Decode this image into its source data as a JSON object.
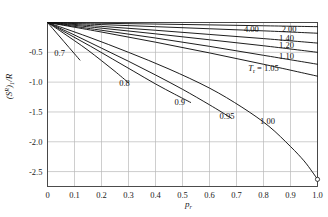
{
  "chart_data": {
    "type": "line",
    "title": "",
    "subtitle": "",
    "xlabel": "p_r",
    "ylabel": "(S^R)_1/R",
    "xlim": [
      0,
      1.0
    ],
    "ylim": [
      -2.75,
      0
    ],
    "grid": true,
    "legend_position": "inline-curve-labels",
    "xticks": [
      "0",
      "0.1",
      "0.2",
      "0.3",
      "0.4",
      "0.5",
      "0.6",
      "0.7",
      "0.8",
      "0.9",
      "1.0"
    ],
    "xtick_values": [
      0,
      0.1,
      0.2,
      0.3,
      0.4,
      0.5,
      0.6,
      0.7,
      0.8,
      0.9,
      1.0
    ],
    "yticks": [
      "-2.5",
      "-2.0",
      "-1.5",
      "-1.0",
      "-0.5",
      "0"
    ],
    "ytick_values": [
      -2.5,
      -2.0,
      -1.5,
      -1.0,
      -0.5,
      0
    ],
    "series_variable": "T_r",
    "critical_point_marker": {
      "x": 1.0,
      "y": -2.63,
      "shape": "open-circle"
    },
    "series": [
      {
        "name": "0.7",
        "label": "0.7",
        "label_x": 0.045,
        "label_y": -0.56,
        "x": [
          0,
          0.02,
          0.04,
          0.06,
          0.08,
          0.1,
          0.12
        ],
        "values": [
          0,
          -0.105,
          -0.21,
          -0.315,
          -0.42,
          -0.525,
          -0.63
        ]
      },
      {
        "name": "0.8",
        "label": "0.8",
        "label_x": 0.285,
        "label_y": -1.06,
        "x": [
          0,
          0.05,
          0.1,
          0.15,
          0.2,
          0.25,
          0.3
        ],
        "values": [
          0,
          -0.15,
          -0.305,
          -0.465,
          -0.64,
          -0.82,
          -1.01
        ]
      },
      {
        "name": "0.9",
        "label": "0.9",
        "label_x": 0.49,
        "label_y": -1.38,
        "x": [
          0,
          0.08,
          0.16,
          0.24,
          0.32,
          0.4,
          0.47,
          0.53
        ],
        "values": [
          0,
          -0.2,
          -0.4,
          -0.61,
          -0.82,
          -1.03,
          -1.2,
          -1.34
        ]
      },
      {
        "name": "0.95",
        "label": "0.95",
        "label_x": 0.665,
        "label_y": -1.62,
        "x": [
          0,
          0.1,
          0.2,
          0.3,
          0.4,
          0.5,
          0.6,
          0.68
        ],
        "values": [
          0,
          -0.21,
          -0.43,
          -0.65,
          -0.88,
          -1.12,
          -1.38,
          -1.6
        ]
      },
      {
        "name": "1.00",
        "label": "1.00",
        "label_x": 0.815,
        "label_y": -1.7,
        "x": [
          0,
          0.15,
          0.3,
          0.45,
          0.6,
          0.72,
          0.82,
          0.9,
          0.95,
          0.98,
          1.0
        ],
        "values": [
          0,
          -0.24,
          -0.5,
          -0.78,
          -1.1,
          -1.42,
          -1.74,
          -2.08,
          -2.32,
          -2.5,
          -2.63
        ]
      },
      {
        "name": "1.05",
        "label": "T_r = 1.05",
        "label_x": 0.8,
        "label_y": -0.82,
        "x": [
          0,
          0.2,
          0.4,
          0.6,
          0.8,
          1.0
        ],
        "values": [
          0,
          -0.16,
          -0.33,
          -0.51,
          -0.7,
          -0.9
        ]
      },
      {
        "name": "1.10",
        "label": "1.10",
        "label_x": 0.885,
        "label_y": -0.62,
        "x": [
          0,
          0.2,
          0.4,
          0.6,
          0.8,
          1.0
        ],
        "values": [
          0,
          -0.13,
          -0.26,
          -0.4,
          -0.55,
          -0.7
        ]
      },
      {
        "name": "1.20",
        "label": "1.20",
        "label_x": 0.885,
        "label_y": -0.435,
        "x": [
          0,
          0.2,
          0.4,
          0.6,
          0.8,
          1.0
        ],
        "values": [
          0,
          -0.095,
          -0.19,
          -0.29,
          -0.39,
          -0.5
        ]
      },
      {
        "name": "1.40",
        "label": "1.40",
        "label_x": 0.885,
        "label_y": -0.305,
        "x": [
          0,
          0.2,
          0.4,
          0.6,
          0.8,
          1.0
        ],
        "values": [
          0,
          -0.065,
          -0.13,
          -0.2,
          -0.27,
          -0.345
        ]
      },
      {
        "name": "2.00",
        "label": "2.00",
        "label_x": 0.895,
        "label_y": -0.165,
        "x": [
          0,
          0.2,
          0.4,
          0.6,
          0.8,
          1.0
        ],
        "values": [
          0,
          -0.035,
          -0.07,
          -0.105,
          -0.14,
          -0.18
        ]
      },
      {
        "name": "4.00",
        "label": "4.00",
        "label_x": 0.755,
        "label_y": -0.165,
        "x": [
          0,
          0.2,
          0.4,
          0.6,
          0.8,
          1.0
        ],
        "values": [
          0,
          -0.013,
          -0.026,
          -0.04,
          -0.055,
          -0.07
        ]
      }
    ]
  },
  "style": {
    "grid_color": "#b9b9b9",
    "axis_color": "#3a3a3a",
    "curve_color": "#111111",
    "background": "#ffffff"
  }
}
